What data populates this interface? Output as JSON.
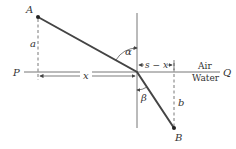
{
  "diagram": {
    "type": "refraction-path",
    "points": {
      "A": {
        "label": "A",
        "x": 38,
        "y": 17
      },
      "B": {
        "label": "B",
        "x": 174,
        "y": 128
      },
      "P": {
        "label": "P"
      },
      "Q": {
        "label": "Q"
      }
    },
    "labels": {
      "a": "a",
      "b": "b",
      "x": "x",
      "s_minus_x": "s − x",
      "alpha": "α",
      "beta": "β",
      "air": "Air",
      "water": "Water"
    },
    "colors": {
      "path": "#444444",
      "line": "#666666",
      "text": "#333333",
      "background": "#ffffff"
    }
  }
}
